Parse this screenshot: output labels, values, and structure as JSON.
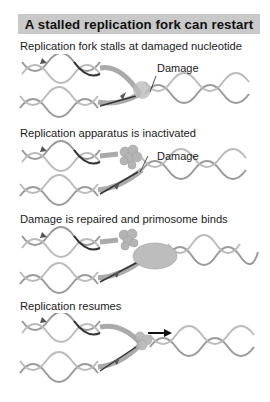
{
  "title": "A stalled replication fork can restart",
  "colors": {
    "title_bg": "#c9c9c9",
    "helix": "#9a9a9a",
    "helix_dark": "#3a3a3a",
    "protein": "#b5b5b5",
    "arrow": "#111111"
  },
  "panels": [
    {
      "caption": "Replication fork stalls at damaged nucleotide",
      "label": "Damage"
    },
    {
      "caption": "Replication apparatus is inactivated",
      "label": "Damage"
    },
    {
      "caption": "Damage is repaired and primosome binds",
      "label": ""
    },
    {
      "caption": "Replication resumes",
      "label": ""
    }
  ]
}
